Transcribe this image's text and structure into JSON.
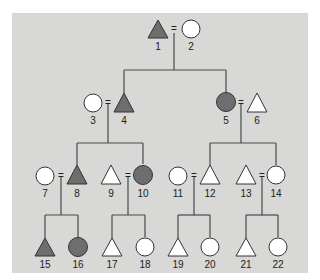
{
  "diagram": {
    "type": "pedigree",
    "colors": {
      "background": "#d8d8d6",
      "affected": "#6e6e6e",
      "unaffected": "#ffffff",
      "line": "#4a4a4a"
    },
    "individuals": [
      {
        "id": "1",
        "sex": "male",
        "affected": true,
        "generation": 1
      },
      {
        "id": "2",
        "sex": "female",
        "affected": false,
        "generation": 1
      },
      {
        "id": "3",
        "sex": "female",
        "affected": false,
        "generation": 2
      },
      {
        "id": "4",
        "sex": "male",
        "affected": true,
        "generation": 2
      },
      {
        "id": "5",
        "sex": "female",
        "affected": true,
        "generation": 2
      },
      {
        "id": "6",
        "sex": "male",
        "affected": false,
        "generation": 2
      },
      {
        "id": "7",
        "sex": "female",
        "affected": false,
        "generation": 3
      },
      {
        "id": "8",
        "sex": "male",
        "affected": true,
        "generation": 3
      },
      {
        "id": "9",
        "sex": "male",
        "affected": false,
        "generation": 3
      },
      {
        "id": "10",
        "sex": "female",
        "affected": true,
        "generation": 3
      },
      {
        "id": "11",
        "sex": "female",
        "affected": false,
        "generation": 3
      },
      {
        "id": "12",
        "sex": "male",
        "affected": false,
        "generation": 3
      },
      {
        "id": "13",
        "sex": "male",
        "affected": false,
        "generation": 3
      },
      {
        "id": "14",
        "sex": "female",
        "affected": false,
        "generation": 3
      },
      {
        "id": "15",
        "sex": "male",
        "affected": true,
        "generation": 4
      },
      {
        "id": "16",
        "sex": "female",
        "affected": true,
        "generation": 4
      },
      {
        "id": "17",
        "sex": "male",
        "affected": false,
        "generation": 4
      },
      {
        "id": "18",
        "sex": "female",
        "affected": false,
        "generation": 4
      },
      {
        "id": "19",
        "sex": "male",
        "affected": false,
        "generation": 4
      },
      {
        "id": "20",
        "sex": "female",
        "affected": false,
        "generation": 4
      },
      {
        "id": "21",
        "sex": "male",
        "affected": false,
        "generation": 4
      },
      {
        "id": "22",
        "sex": "female",
        "affected": false,
        "generation": 4
      }
    ],
    "marriages": [
      {
        "partners": [
          "1",
          "2"
        ],
        "children": [
          "4",
          "5"
        ]
      },
      {
        "partners": [
          "3",
          "4"
        ],
        "children": [
          "8",
          "10"
        ]
      },
      {
        "partners": [
          "5",
          "6"
        ],
        "children": [
          "12",
          "13"
        ]
      },
      {
        "partners": [
          "7",
          "8"
        ],
        "children": [
          "15",
          "16"
        ]
      },
      {
        "partners": [
          "9",
          "10"
        ],
        "children": [
          "17",
          "18"
        ]
      },
      {
        "partners": [
          "11",
          "12"
        ],
        "children": [
          "19",
          "20"
        ]
      },
      {
        "partners": [
          "13",
          "14"
        ],
        "children": [
          "21",
          "22"
        ]
      }
    ],
    "marriage_symbol": "="
  }
}
